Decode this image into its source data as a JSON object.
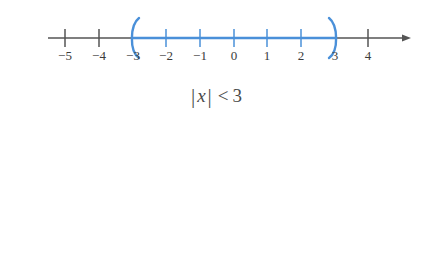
{
  "figure": {
    "background_color": "#ffffff",
    "axis_color": "#555555",
    "highlight_color": "#4a90d9",
    "label_color": "#3b3b3b"
  },
  "number_lines": [
    {
      "id": "number-line-less-than",
      "caption": {
        "open_bar": "|",
        "variable": "x",
        "close_bar": "|",
        "relation": "<",
        "value": "3",
        "full_text": "|x| < 3"
      },
      "ticks": [
        {
          "value": -5,
          "label": "−5",
          "x": 65
        },
        {
          "value": -4,
          "label": "−4",
          "x": 99
        },
        {
          "value": -3,
          "label": "−3",
          "x": 133
        },
        {
          "value": -2,
          "label": "−2",
          "x": 166
        },
        {
          "value": -1,
          "label": "−1",
          "x": 200
        },
        {
          "value": 0,
          "label": "0",
          "x": 234
        },
        {
          "value": 1,
          "label": "1",
          "x": 267
        },
        {
          "value": 2,
          "label": "2",
          "x": 301
        },
        {
          "value": 3,
          "label": "3",
          "x": 335
        },
        {
          "value": 4,
          "label": "4",
          "x": 368
        }
      ],
      "interval": {
        "type": "open",
        "left_endpoint": -3,
        "right_endpoint": 3,
        "left_bracket": "(",
        "right_bracket": ")",
        "highlighted_from_x": 133,
        "highlighted_to_x": 335
      },
      "axis": {
        "start_x": 48,
        "end_x": 408,
        "y": 38,
        "left_arrow": false,
        "right_arrow": true,
        "right_arrow_color": "#555555",
        "left_ray_highlighted": false,
        "right_ray_highlighted": false
      }
    },
    {
      "id": "number-line-greater-than",
      "caption": {
        "open_bar": "|",
        "variable": "x",
        "close_bar": "|",
        "relation": ">",
        "value": "3",
        "full_text": "|x| > 3"
      },
      "ticks": [
        {
          "value": -5,
          "label": "−5",
          "x": 78
        },
        {
          "value": -4,
          "label": "−4",
          "x": 110
        },
        {
          "value": -3,
          "label": "−3",
          "x": 143
        },
        {
          "value": -2,
          "label": "−2",
          "x": 176
        },
        {
          "value": -1,
          "label": "−1",
          "x": 209
        },
        {
          "value": 0,
          "label": "0",
          "x": 242
        },
        {
          "value": 1,
          "label": "1",
          "x": 275
        },
        {
          "value": 2,
          "label": "2",
          "x": 308
        },
        {
          "value": 3,
          "label": "3",
          "x": 341
        },
        {
          "value": 4,
          "label": "4",
          "x": 374
        }
      ],
      "interval": {
        "type": "exterior-open",
        "left_endpoint": -3,
        "right_endpoint": 3,
        "left_bracket": ")",
        "right_bracket": "(",
        "highlighted_from_x": 341,
        "highlighted_to_x": 143
      },
      "axis": {
        "start_x": 35,
        "end_x": 410,
        "y": 180,
        "left_arrow": false,
        "right_arrow": true,
        "right_arrow_color": "#4a90d9",
        "left_ray_highlighted": true,
        "right_ray_highlighted": true
      }
    }
  ]
}
